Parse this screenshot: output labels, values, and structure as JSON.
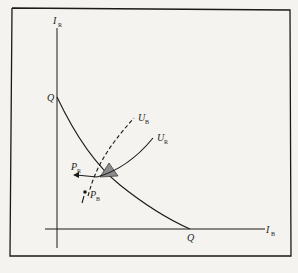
{
  "diagram": {
    "type": "economics-edgeworth-style",
    "axes": {
      "vertical": {
        "label": "I",
        "subscript": "R"
      },
      "horizontal": {
        "label": "I",
        "subscript": "B"
      }
    },
    "frontier": {
      "intercept_vertical_label": "Q",
      "intercept_horizontal_label": "Q"
    },
    "curves": [
      {
        "name": "U",
        "subscript": "R",
        "style": "solid"
      },
      {
        "name": "U",
        "subscript": "B",
        "style": "dashed"
      }
    ],
    "points": [
      {
        "name": "P",
        "subscript": "R"
      },
      {
        "name": "P",
        "subscript": "B"
      }
    ],
    "path_label": "I",
    "colors": {
      "line": "#1a1a1a",
      "background": "#f4f3ef",
      "shade": "#8c8c8c"
    }
  }
}
